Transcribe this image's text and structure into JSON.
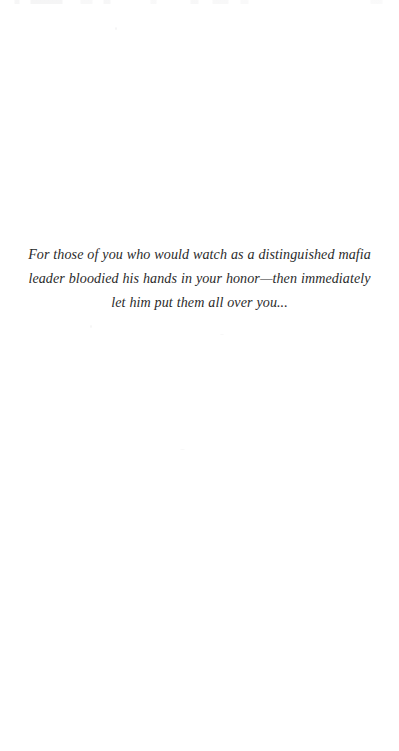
{
  "page": {
    "type": "book-dedication-page",
    "background_color": "#ffffff",
    "text_color": "#2b2b2b"
  },
  "dedication": {
    "full_text": "For those of you who would watch as a distinguished mafia leader bloodied his hands in your honor—then immediately let him put them all over you...",
    "lines": [
      "For those of you who would watch as a distinguished mafia",
      "leader bloodied his hands in your honor—then immediately",
      "let him put them all over you..."
    ],
    "alignment": "center",
    "style": "italic-serif"
  }
}
